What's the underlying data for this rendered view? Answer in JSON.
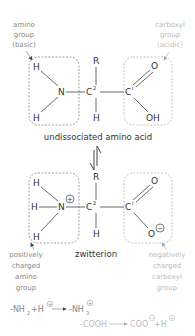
{
  "diagram": {
    "labels": {
      "amino_group": [
        "amino",
        "group",
        "(basic)"
      ],
      "carboxyl_group": [
        "carboxyl",
        "group",
        "(acidic)"
      ],
      "positively_charged": [
        "positively",
        "charged",
        "amino",
        "group"
      ],
      "negatively_charged": [
        "negatively",
        "charged",
        "carboxyl",
        "group"
      ]
    },
    "captions": {
      "undissociated": "undissociated amino acid",
      "zwitterion": "zwitterion"
    },
    "atoms": {
      "H": "H",
      "N": "N",
      "R": "R",
      "C2": "C",
      "C2_sup": "2",
      "C1": "C",
      "C1_sup": "I",
      "O": "O",
      "OH": "OH",
      "plus": "+",
      "minus": "−"
    },
    "equations": {
      "eq1_left": "-NH",
      "eq1_left_sub": "2",
      "eq1_plus_H": "+H",
      "eq1_right": "-NH",
      "eq1_right_sub": "3",
      "eq2_left": "-COOH",
      "eq2_right": "COO",
      "eq2_plus_H": "+H"
    },
    "colors": {
      "structure": "#333333",
      "amino_label": "#888888",
      "carboxyl_label": "#bbbbbb",
      "box_amino": "#777777",
      "box_carboxyl": "#aaaaaa"
    }
  }
}
